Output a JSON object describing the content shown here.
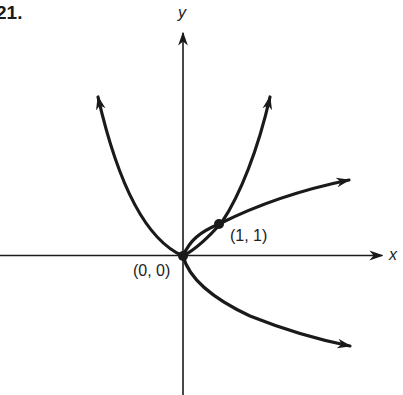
{
  "problem": {
    "number": "21."
  },
  "axes": {
    "x_label": "x",
    "y_label": "y"
  },
  "points": [
    {
      "label": "(0, 0)",
      "x": 0,
      "y": 0
    },
    {
      "label": "(1, 1)",
      "x": 1,
      "y": 1
    }
  ],
  "curves": [
    {
      "name": "y = x^2 (left branch)",
      "direction": "up-left"
    },
    {
      "name": "y = x^2 (right branch)",
      "direction": "up-right"
    },
    {
      "name": "y = sqrt(x)",
      "direction": "right-up"
    },
    {
      "name": "y = -sqrt(x)",
      "direction": "right-down"
    }
  ],
  "colors": {
    "ink": "#1a1a1a",
    "background": "#ffffff"
  }
}
